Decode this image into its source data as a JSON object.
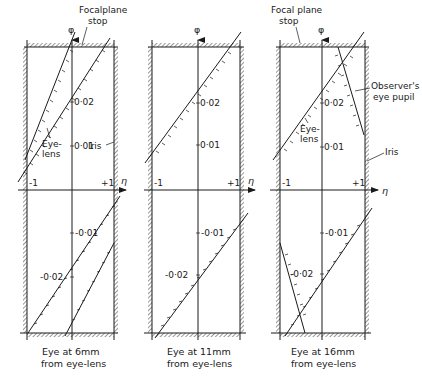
{
  "figure": {
    "axis_labels": {
      "vertical": "φ",
      "horizontal": "η"
    },
    "tick_labels": {
      "minus_one": "-1",
      "plus_one": "+1"
    },
    "panels": [
      {
        "id": "panel-6mm",
        "caption_line1": "Eye at 6mm",
        "caption_line2": "from eye-lens",
        "value_labels": {
          "p002": "0·02",
          "p001": "0·01",
          "m001": "-0·01",
          "m002": "-0·02"
        },
        "annotations": {
          "focal_stop_line1": "Focalplane",
          "focal_stop_line2": "stop",
          "eye_lens_line1": "Eye-",
          "eye_lens_line2": "lens",
          "iris": "Iris"
        }
      },
      {
        "id": "panel-11mm",
        "caption_line1": "Eye at 11mm",
        "caption_line2": "from eye-lens",
        "value_labels": {
          "p002": "0·02",
          "p001": "0·01",
          "m001": "-0·01",
          "m002": "-0·02"
        }
      },
      {
        "id": "panel-16mm",
        "caption_line1": "Eye at 16mm",
        "caption_line2": "from eye-lens",
        "value_labels": {
          "p002": "0·02",
          "p001": "0·01",
          "m001": "-0·01",
          "m002": "-0·02"
        },
        "annotations": {
          "focal_stop_line1": "Focal plane",
          "focal_stop_line2": "stop",
          "observer_line1": "Observer's",
          "observer_line2": "eye pupil",
          "eye_lens_line1": "Eye-",
          "eye_lens_line2": "lens",
          "iris": "Iris"
        }
      }
    ]
  },
  "colors": {
    "ink": "#1a1a1a",
    "background": "#ffffff"
  }
}
